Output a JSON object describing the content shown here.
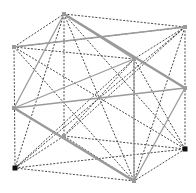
{
  "diagram": {
    "type": "cube-with-inscribed-solid",
    "colors": {
      "dashed": "#333333",
      "solid": "#9a9a9a",
      "vertex_dark": "#111111",
      "vertex_light": "#9a9a9a"
    },
    "vertices": {
      "A": [
        64,
        14
      ],
      "B": [
        185,
        27
      ],
      "C": [
        134,
        59
      ],
      "D": [
        14,
        47
      ],
      "E": [
        64,
        136
      ],
      "F": [
        185,
        149
      ],
      "G": [
        134,
        181
      ],
      "H": [
        15,
        168
      ],
      "M1": [
        14,
        108
      ],
      "M2": [
        185,
        88
      ]
    },
    "dashed_edges": [
      [
        "A",
        "B"
      ],
      [
        "B",
        "C"
      ],
      [
        "C",
        "D"
      ],
      [
        "D",
        "A"
      ],
      [
        "E",
        "F"
      ],
      [
        "F",
        "G"
      ],
      [
        "G",
        "H"
      ],
      [
        "H",
        "E"
      ],
      [
        "A",
        "E"
      ],
      [
        "B",
        "F"
      ],
      [
        "C",
        "G"
      ],
      [
        "D",
        "H"
      ],
      [
        "A",
        "G"
      ],
      [
        "B",
        "H"
      ],
      [
        "C",
        "E"
      ],
      [
        "D",
        "F"
      ],
      [
        "D",
        "B"
      ],
      [
        "A",
        "F"
      ],
      [
        "B",
        "G"
      ],
      [
        "D",
        "G"
      ],
      [
        "A",
        "H"
      ],
      [
        "H",
        "C"
      ],
      [
        "H",
        "F"
      ],
      [
        "E",
        "G"
      ],
      [
        "F",
        "C"
      ],
      [
        "E",
        "B"
      ]
    ],
    "solid_edges": [
      [
        "A",
        "C"
      ],
      [
        "C",
        "G"
      ],
      [
        "M1",
        "C"
      ],
      [
        "M1",
        "G"
      ],
      [
        "M2",
        "A"
      ],
      [
        "M2",
        "G"
      ],
      [
        "D",
        "B"
      ],
      [
        "A",
        "M1"
      ],
      [
        "M1",
        "M2"
      ]
    ],
    "thick_solid_edges": [
      [
        "A",
        "M2"
      ],
      [
        "M1",
        "G"
      ]
    ],
    "dark_points": [
      "H",
      "F"
    ],
    "light_points": [
      "A",
      "B",
      "C",
      "D",
      "E",
      "G",
      "M1",
      "M2"
    ]
  }
}
